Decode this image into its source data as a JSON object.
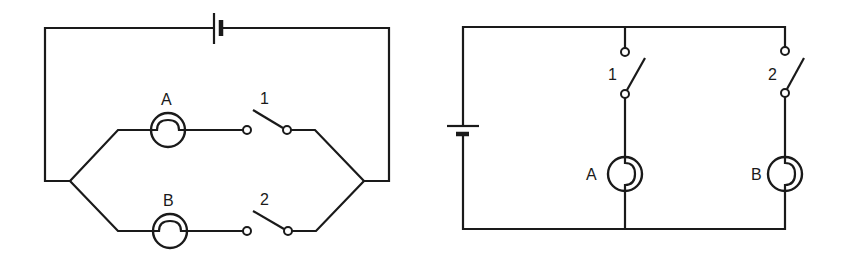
{
  "figure": {
    "colors": {
      "line": "#1a1a1a",
      "background": "#ffffff"
    }
  },
  "left_circuit": {
    "lamps": [
      {
        "label": "A"
      },
      {
        "label": "B"
      }
    ],
    "switches": [
      {
        "label": "1",
        "state": "open"
      },
      {
        "label": "2",
        "state": "open"
      }
    ],
    "battery": {
      "orientation": "horizontal"
    }
  },
  "right_circuit": {
    "lamps": [
      {
        "label": "A"
      },
      {
        "label": "B"
      }
    ],
    "switches": [
      {
        "label": "1",
        "state": "open"
      },
      {
        "label": "2",
        "state": "open"
      }
    ],
    "battery": {
      "orientation": "vertical"
    }
  }
}
